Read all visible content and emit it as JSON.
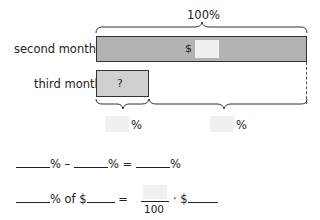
{
  "top_brace_label": "100%",
  "rows": [
    {
      "label": "second month",
      "bar_text": "$"
    },
    {
      "label": "third month",
      "bar_text": "?"
    }
  ],
  "bottom_labels": [
    {
      "suffix": "%"
    },
    {
      "suffix": "%"
    }
  ],
  "equation1": {
    "op1": "% –",
    "op2": "% =",
    "op3": "%"
  },
  "equation2": {
    "part1": "% of $",
    "equals": "=",
    "denominator": "100",
    "times": "· $"
  },
  "colors": {
    "bar_second": "#b3b3b3",
    "bar_third": "#d0d0d0",
    "blank": "#f0f0f0",
    "stroke": "#333333"
  }
}
